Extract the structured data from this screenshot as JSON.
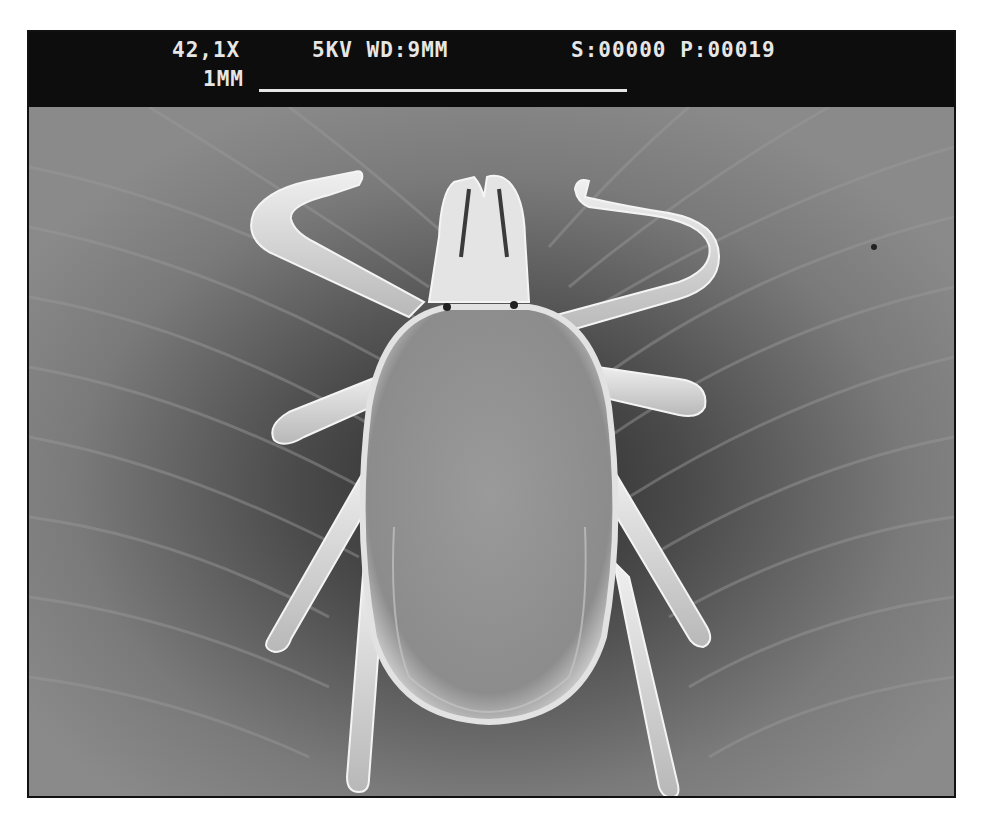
{
  "micrograph": {
    "type": "scanning electron micrograph",
    "subject": "tick (dorsal view)",
    "databar": {
      "magnification": "42,1X",
      "accelerating_voltage": "5KV",
      "working_distance": "WD:9MM",
      "kv_wd_text": "5KV WD:9MM",
      "s_counter": "S:00000",
      "p_counter": "P:00019",
      "sp_text": "S:00000 P:00019",
      "scale_label": "1MM"
    },
    "colors": {
      "databar_bg": "#0d0d0d",
      "databar_text": "#e6e6e6",
      "substrate": "#7c7c7c",
      "specimen_highlight": "#e8e8e8",
      "shadow": "#2a2a2a",
      "frame_border": "#111111"
    }
  }
}
